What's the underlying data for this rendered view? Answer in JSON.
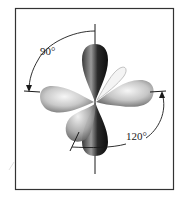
{
  "diagram": {
    "frame": {
      "x": 15,
      "y": 8,
      "width": 159,
      "height": 182,
      "stroke": "#333333"
    },
    "center": {
      "x": 95,
      "y": 102
    },
    "angles": [
      {
        "id": "axial-equatorial",
        "label": "90°",
        "label_x": 40,
        "label_y": 55
      },
      {
        "id": "equatorial-equatorial",
        "label": "120°",
        "label_x": 124,
        "label_y": 140
      }
    ],
    "lobes": [
      {
        "id": "top",
        "shade": "dark"
      },
      {
        "id": "bottom",
        "shade": "dark"
      },
      {
        "id": "left",
        "shade": "light"
      },
      {
        "id": "right",
        "shade": "light"
      },
      {
        "id": "front-lower-left",
        "shade": "light"
      },
      {
        "id": "back-upper-right",
        "shade": "outline"
      }
    ],
    "colors": {
      "dark_lobe": "#1c1c1c",
      "light_lobe": "#bdbdbd",
      "highlight": "#f2f2f2",
      "line": "#1a1a1a"
    }
  }
}
